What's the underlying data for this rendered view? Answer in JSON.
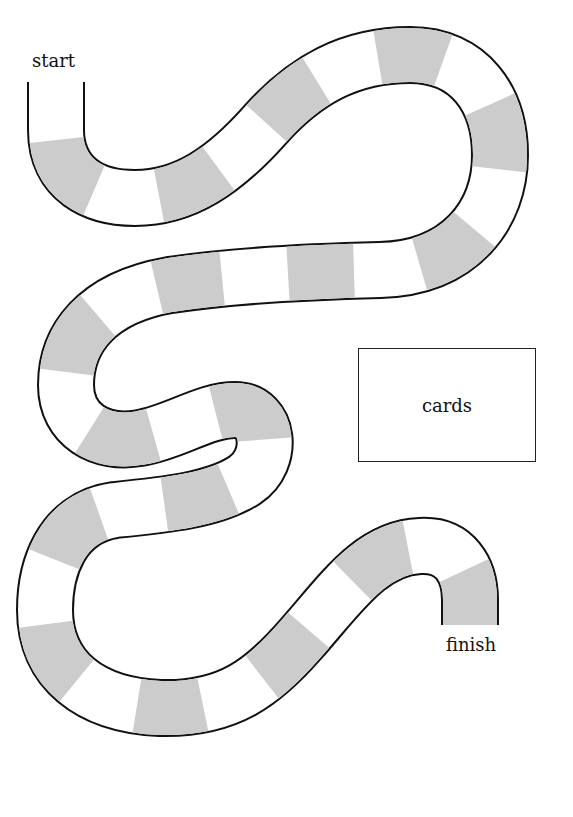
{
  "board": {
    "start_label": "start",
    "finish_label": "finish",
    "cards_label": "cards",
    "colors": {
      "outline": "#111111",
      "track": "#ffffff",
      "shaded_space": "#cccccc",
      "background": "#ffffff"
    },
    "track_width_px": 56,
    "space_pattern": "alternating white and gray spaces",
    "shaded_space_count": 18
  }
}
